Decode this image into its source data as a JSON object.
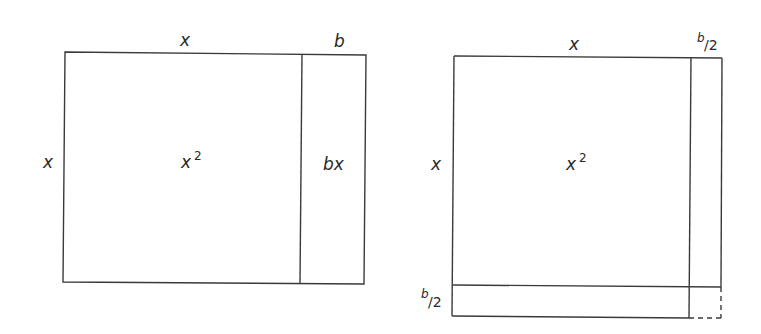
{
  "diagram": {
    "left_figure": {
      "top_label_main": "x",
      "top_label_extra": "b",
      "side_label": "x",
      "main_area_label": "x",
      "main_area_exp": "2",
      "strip_area_label": "bx"
    },
    "right_figure": {
      "top_label_main": "x",
      "top_label_extra_num": "b",
      "top_label_extra_den": "/2",
      "side_label": "x",
      "bottom_side_num": "b",
      "bottom_side_den": "/2",
      "main_area_label": "x",
      "main_area_exp": "2"
    },
    "colors": {
      "line": "#3a3a3a",
      "text": "#2a2a2a",
      "background": "#ffffff"
    }
  }
}
